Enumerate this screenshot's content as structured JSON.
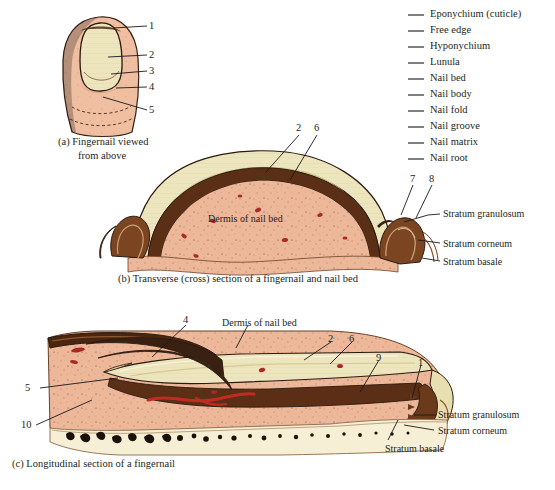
{
  "figure": {
    "title_parts": [
      "(a) Fingernail viewed",
      "from above",
      "(b) Transverse (cross) section of a fingernail and nail bed",
      "(c) Longitudinal section of a fingernail"
    ]
  },
  "legend": {
    "items": [
      {
        "label": "Eponychium (cuticle)"
      },
      {
        "label": "Free edge"
      },
      {
        "label": "Hyponychium"
      },
      {
        "label": "Lunula"
      },
      {
        "label": "Nail bed"
      },
      {
        "label": "Nail body"
      },
      {
        "label": "Nail fold"
      },
      {
        "label": "Nail groove"
      },
      {
        "label": "Nail matrix"
      },
      {
        "label": "Nail root"
      }
    ]
  },
  "panel_a": {
    "caption_line1": "(a) Fingernail viewed",
    "caption_line2": "from above",
    "numbers": [
      "1",
      "2",
      "3",
      "4",
      "5"
    ]
  },
  "panel_b": {
    "caption": "(b) Transverse (cross) section of a fingernail and nail bed",
    "numbers": [
      "2",
      "6",
      "7",
      "8"
    ],
    "inner_label": "Dermis of nail bed",
    "strata": [
      "Stratum granulosum",
      "Stratum corneum",
      "Stratum basale"
    ]
  },
  "panel_c": {
    "caption": "(c) Longitudinal section of a fingernail",
    "numbers": [
      "4",
      "5",
      "10",
      "2",
      "6",
      "9",
      "1"
    ],
    "inner_label": "Dermis of nail bed",
    "strata": [
      "Stratum granulosum",
      "Stratum corneum",
      "Stratum basale"
    ]
  },
  "colors": {
    "skin": "#edb79a",
    "skin_light": "#f2c6ab",
    "nail_plate": "#ece5bd",
    "nail_plate_dark": "#ddd49c",
    "epidermis_dark": "#6b3a1c",
    "dermis": "#edb79a",
    "bone": "#f5ecd2",
    "blood": "#b52a2a",
    "outline": "#2b1a10",
    "text": "#231f20"
  }
}
